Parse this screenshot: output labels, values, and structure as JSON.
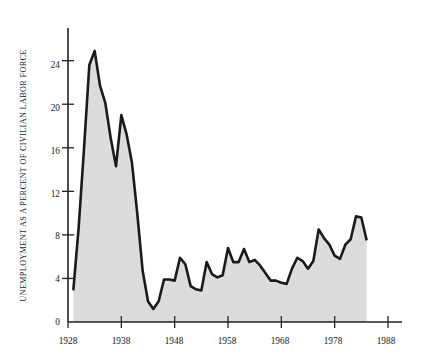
{
  "figure": {
    "background_color": "#ffffff",
    "axis_color": "#222222",
    "line_color": "#1a1a1a",
    "fill_color": "#dcdcdc"
  },
  "chart_data": {
    "type": "area",
    "title": "",
    "subtitle": "",
    "xlabel": "",
    "ylabel": "UNEMPLOYMENT AS A PERCENT OF CIVILIAN LABOR FORCE",
    "xlim": [
      1928,
      1988
    ],
    "ylim": [
      0,
      27
    ],
    "grid": false,
    "legend": "none",
    "xticks": [
      1928,
      1938,
      1948,
      1958,
      1968,
      1978,
      1988
    ],
    "xtick_labels": [
      "1928",
      "1938",
      "1948",
      "1958",
      "1968",
      "1978",
      "1988"
    ],
    "yticks": [
      0,
      4,
      8,
      12,
      16,
      20,
      24
    ],
    "ytick_labels": [
      "0",
      "4",
      "8",
      "12",
      "16",
      "20",
      "24"
    ],
    "series": [
      {
        "name": "Unemployment rate",
        "x": [
          1929,
          1930,
          1931,
          1932,
          1933,
          1934,
          1935,
          1936,
          1937,
          1938,
          1939,
          1940,
          1941,
          1942,
          1943,
          1944,
          1945,
          1946,
          1947,
          1948,
          1949,
          1950,
          1951,
          1952,
          1953,
          1954,
          1955,
          1956,
          1957,
          1958,
          1959,
          1960,
          1961,
          1962,
          1963,
          1964,
          1965,
          1966,
          1967,
          1968,
          1969,
          1970,
          1971,
          1972,
          1973,
          1974,
          1975,
          1976,
          1977,
          1978,
          1979,
          1980,
          1981,
          1982,
          1983,
          1984
        ],
        "values": [
          2.9,
          8.7,
          15.9,
          23.6,
          24.9,
          21.7,
          20.1,
          16.9,
          14.3,
          19.0,
          17.2,
          14.6,
          9.9,
          4.7,
          1.9,
          1.2,
          1.9,
          3.9,
          3.9,
          3.8,
          5.9,
          5.3,
          3.3,
          3.0,
          2.9,
          5.5,
          4.4,
          4.1,
          4.3,
          6.8,
          5.5,
          5.5,
          6.7,
          5.5,
          5.7,
          5.2,
          4.5,
          3.8,
          3.8,
          3.6,
          3.5,
          4.9,
          5.9,
          5.6,
          4.9,
          5.6,
          8.5,
          7.7,
          7.1,
          6.1,
          5.8,
          7.1,
          7.6,
          9.7,
          9.6,
          7.5
        ]
      }
    ],
    "annotations": []
  },
  "axis": {
    "y_axis_name": "y-axis",
    "x_axis_name": "x-axis"
  }
}
